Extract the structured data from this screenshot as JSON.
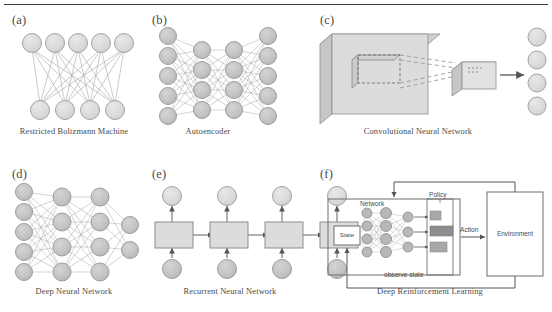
{
  "figure": {
    "background": "#ffffff",
    "rule_color": "#3a3a3a",
    "node_fill": "#d9d9d9",
    "node_stroke": "#9a9a9a",
    "edge_color": "#9a9a9a",
    "box_fill": "#dcdcdc",
    "box_stroke": "#8c8c8c",
    "arrow_color": "#555555",
    "text_color": "#4a4a4a"
  },
  "panels": [
    {
      "id": "a",
      "label": "(a)",
      "caption": "Restricted Boltzmann Machine",
      "type": "bipartite-graph",
      "layers": [
        5,
        4
      ]
    },
    {
      "id": "b",
      "label": "(b)",
      "caption": "Autoencoder",
      "type": "feedforward-network",
      "layers": [
        5,
        4,
        4,
        5
      ]
    },
    {
      "id": "c",
      "label": "(c)",
      "caption": "Convolutional Neural Network",
      "type": "conv-volume-diagram",
      "output_nodes": 4
    },
    {
      "id": "d",
      "label": "(d)",
      "caption": "Deep Neural Network",
      "type": "feedforward-network",
      "layers": [
        5,
        4,
        4,
        2
      ]
    },
    {
      "id": "e",
      "label": "(e)",
      "caption": "Recurrent Neural Network",
      "type": "unrolled-recurrent",
      "time_steps": 4
    },
    {
      "id": "f",
      "label": "(f)",
      "caption": "Deep Reinforcement Learning",
      "type": "rl-block-diagram",
      "blocks": {
        "state": "State",
        "network": "Network",
        "policy": "Policy",
        "action": "Action",
        "environment": "Environment",
        "observe": "observe state"
      },
      "network_layers": [
        4,
        4,
        3
      ],
      "policy_bars": [
        0.45,
        1.0,
        0.72
      ]
    }
  ]
}
